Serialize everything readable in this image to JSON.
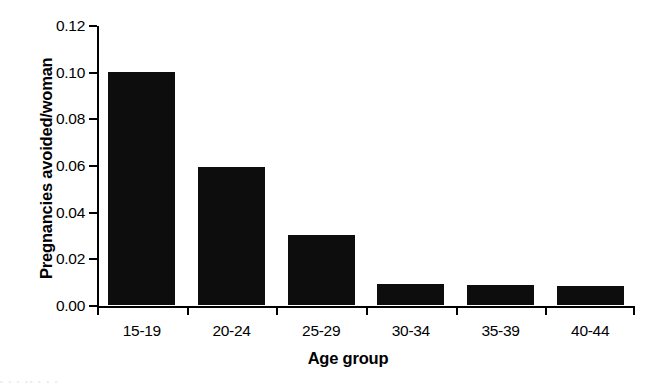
{
  "chart_data": {
    "type": "bar",
    "title": "",
    "categories": [
      "15-19",
      "20-24",
      "25-29",
      "30-34",
      "35-39",
      "40-44"
    ],
    "values": [
      0.1,
      0.059,
      0.03,
      0.009,
      0.0085,
      0.008
    ],
    "series": [
      {
        "name": "Pregnancies avoided/woman",
        "values": [
          0.1,
          0.059,
          0.03,
          0.009,
          0.0085,
          0.008
        ]
      }
    ],
    "xlabel": "Age group",
    "ylabel": "Pregnancies avoided/woman",
    "ylim": [
      0.0,
      0.12
    ],
    "xlim": [
      0,
      6
    ],
    "ytick_labels": [
      "0.00",
      "0.02",
      "0.04",
      "0.06",
      "0.08",
      "0.10",
      "0.12"
    ],
    "ytick_values": [
      0.0,
      0.02,
      0.04,
      0.06,
      0.08,
      0.1,
      0.12
    ],
    "xtick_labels": [
      "15-19",
      "20-24",
      "25-29",
      "30-34",
      "35-39",
      "40-44"
    ],
    "grid": false,
    "legend": false,
    "legend_position": "none",
    "bar_color": "#0d0d0d",
    "axis_color": "#000000",
    "background_color": "#ffffff"
  },
  "figure": {
    "caption_remnant": "• •   •    ••      • •  •"
  }
}
